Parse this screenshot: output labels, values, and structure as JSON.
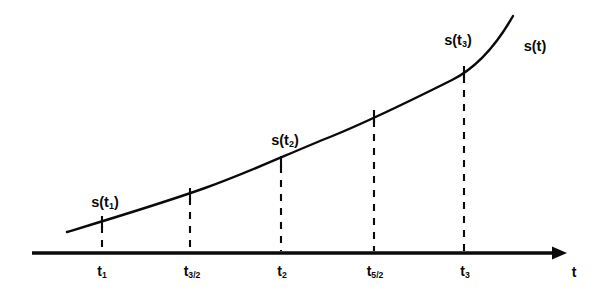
{
  "figure": {
    "background_color": "#ffffff",
    "ink_color": "#0a0a0a",
    "width": 599,
    "height": 302
  },
  "chart_data": {
    "type": "line",
    "title": "",
    "xlabel": "t",
    "ylabel": "",
    "grid": false,
    "legend": "none",
    "axis": {
      "x_axis_label": "t",
      "x_axis_arrow": true,
      "y_axis_shown": false,
      "x_axis_pixel_y": 253,
      "x_axis_pixel_start": 32,
      "x_axis_pixel_end": 565
    },
    "curve_label": "s(t)",
    "curve_points_pixels": [
      [
        67,
        232
      ],
      [
        102,
        222
      ],
      [
        145,
        208
      ],
      [
        190,
        194
      ],
      [
        235,
        178
      ],
      [
        281,
        162
      ],
      [
        327,
        140
      ],
      [
        374,
        116
      ],
      [
        420,
        95
      ],
      [
        464,
        72
      ],
      [
        490,
        46
      ],
      [
        513,
        16
      ]
    ],
    "tick_labels": [
      "t1",
      "t3/2",
      "t2",
      "t5/2",
      "t3"
    ],
    "samples": [
      {
        "id": "t1",
        "tick_label_base": "t",
        "tick_label_sub": "1",
        "value_label": "s(t",
        "value_label_sub": "1",
        "value_label_end": ")",
        "has_value_label": true,
        "x": 102,
        "curve_y": 222,
        "label_x": 105,
        "label_y": 203,
        "tick_label_x": 102,
        "tick_label_y": 272
      },
      {
        "id": "t3/2",
        "tick_label_base": "t",
        "tick_label_sub": "3/2",
        "value_label": "",
        "value_label_sub": "",
        "value_label_end": "",
        "has_value_label": false,
        "x": 190,
        "curve_y": 194,
        "label_x": 190,
        "label_y": 175,
        "tick_label_x": 192,
        "tick_label_y": 272
      },
      {
        "id": "t2",
        "tick_label_base": "t",
        "tick_label_sub": "2",
        "value_label": "s(t",
        "value_label_sub": "2",
        "value_label_end": ")",
        "has_value_label": true,
        "x": 281,
        "curve_y": 162,
        "label_x": 285,
        "label_y": 141,
        "tick_label_x": 282,
        "tick_label_y": 272
      },
      {
        "id": "t5/2",
        "tick_label_base": "t",
        "tick_label_sub": "5/2",
        "value_label": "",
        "value_label_sub": "",
        "value_label_end": "",
        "has_value_label": false,
        "x": 374,
        "curve_y": 116,
        "label_x": 374,
        "label_y": 97,
        "tick_label_x": 375,
        "tick_label_y": 272
      },
      {
        "id": "t3",
        "tick_label_base": "t",
        "tick_label_sub": "3",
        "value_label": "s(t",
        "value_label_sub": "3",
        "value_label_end": ")",
        "has_value_label": true,
        "x": 464,
        "curve_y": 72,
        "label_x": 458,
        "label_y": 41,
        "tick_label_x": 465,
        "tick_label_y": 272
      }
    ]
  },
  "labels": {
    "curve_name": "s(t)",
    "curve_name_x": 535,
    "curve_name_y": 46,
    "axis_name": "t",
    "axis_name_x": 574,
    "axis_name_y": 272
  }
}
